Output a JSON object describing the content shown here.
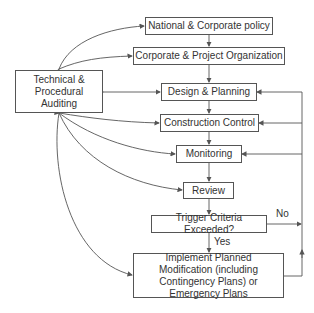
{
  "diagram": {
    "type": "flowchart",
    "nodes": {
      "policy": "National & Corporate policy",
      "organization": "Corporate & Project Organization",
      "auditing": "Technical & Procedural Auditing",
      "design": "Design & Planning",
      "construction": "Construction Control",
      "monitoring": "Monitoring",
      "review": "Review",
      "trigger": "Trigger Criteria Exceeded?",
      "implement": "Implement Planned Modification (including Contingency Plans) or Emergency Plans"
    },
    "edge_labels": {
      "no": "No",
      "yes": "Yes"
    },
    "colors": {
      "line": "#555555",
      "text": "#333333"
    }
  }
}
